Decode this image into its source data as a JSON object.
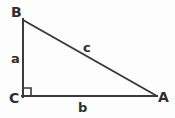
{
  "figure": {
    "kind": "right-triangle-diagram",
    "width": 175,
    "height": 118,
    "background_color": "#fdfdfd",
    "stroke_color": "#3a3a3a",
    "label_color": "#2f2f2f",
    "stroke_width": 2
  },
  "vertices": {
    "B": {
      "label": "B",
      "x": 22,
      "y": 19
    },
    "C": {
      "label": "C",
      "x": 22,
      "y": 97
    },
    "A": {
      "label": "A",
      "x": 157,
      "y": 97
    }
  },
  "sides": {
    "a": {
      "label": "a",
      "from": "B",
      "to": "C",
      "description": "vertical leg"
    },
    "b": {
      "label": "b",
      "from": "C",
      "to": "A",
      "description": "horizontal leg"
    },
    "c": {
      "label": "c",
      "from": "B",
      "to": "A",
      "description": "hypotenuse"
    }
  },
  "right_angle": {
    "at_vertex": "C",
    "marker": "square",
    "size": 8
  }
}
